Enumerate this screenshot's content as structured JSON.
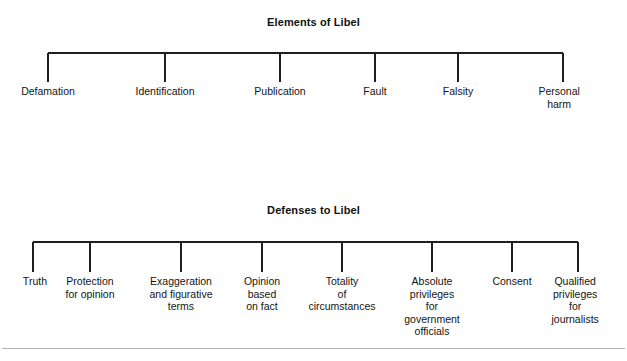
{
  "page": {
    "width": 627,
    "height": 361,
    "background_color": "#ffffff",
    "line_color": "#1f1f1f",
    "text_color": "#141414",
    "rule_color": "#b4b4b4"
  },
  "diagrams": [
    {
      "id": "elements-of-libel",
      "title": "Elements of Libel",
      "bar_y": 53,
      "bar_x_start": 48,
      "bar_x_end": 563,
      "tick_bottom_y": 82,
      "nodes": [
        {
          "label": "Defamation",
          "x": 48
        },
        {
          "label": "Identification",
          "x": 165
        },
        {
          "label": "Publication",
          "x": 280
        },
        {
          "label": "Fault",
          "x": 375
        },
        {
          "label": "Falsity",
          "x": 458
        },
        {
          "label": "Personal harm",
          "x": 563
        }
      ]
    },
    {
      "id": "defenses-to-libel",
      "title": "Defenses to Libel",
      "bar_y": 242,
      "bar_x_start": 33,
      "bar_x_end": 578,
      "tick_bottom_y": 272,
      "nodes": [
        {
          "label": "Truth",
          "x": 33
        },
        {
          "label": "Protection\nfor opinion",
          "x": 90
        },
        {
          "label": "Exaggeration\nand figurative\nterms",
          "x": 181
        },
        {
          "label": "Opinion\nbased\non fact",
          "x": 262
        },
        {
          "label": "Totality\nof\ncircumstances",
          "x": 342
        },
        {
          "label": "Absolute\nprivileges\nfor\ngovernment\nofficials",
          "x": 432
        },
        {
          "label": "Consent",
          "x": 512
        },
        {
          "label": "Qualified\nprivileges\nfor\njournalists",
          "x": 578
        }
      ]
    }
  ]
}
